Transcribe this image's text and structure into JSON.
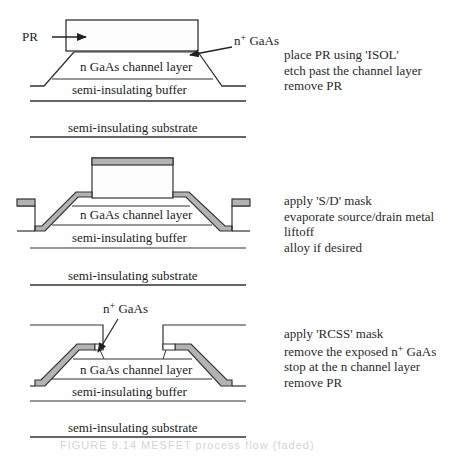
{
  "diagram": {
    "type": "process-flow cross-sections",
    "colors": {
      "line": "#333333",
      "metal": "#b3b3b3",
      "background": "#ffffff"
    },
    "panels": [
      {
        "id": "isolation",
        "labels": {
          "pr": "PR",
          "nplus_prefix": "n",
          "nplus_sup": "+",
          "nplus_suffix": " GaAs",
          "channel": "n GaAs channel layer",
          "buffer": "semi-insulating buffer",
          "substrate": "semi-insulating substrate"
        },
        "steps": [
          "place PR using 'ISOL'",
          "etch past the channel layer",
          "remove PR"
        ]
      },
      {
        "id": "source-drain",
        "labels": {
          "channel": "n GaAs channel layer",
          "buffer": "semi-insulating buffer",
          "substrate": "semi-insulating substrate"
        },
        "steps": [
          "apply 'S/D' mask",
          "evaporate source/drain metal",
          "liftoff",
          "alloy if desired"
        ]
      },
      {
        "id": "recess",
        "labels": {
          "nplus_prefix": "n",
          "nplus_sup": "+",
          "nplus_suffix": " GaAs",
          "channel": "n GaAs channel layer",
          "buffer": "semi-insulating buffer",
          "substrate": "semi-insulating substrate"
        },
        "steps": {
          "s1": "apply 'RCSS' mask",
          "s2_prefix": "remove the exposed n",
          "s2_sup": "+",
          "s2_suffix": " GaAs",
          "s3": "stop at the n channel layer",
          "s4": "remove PR"
        }
      }
    ],
    "caption": "FIGURE 9.14  MESFET process flow (faded)"
  }
}
